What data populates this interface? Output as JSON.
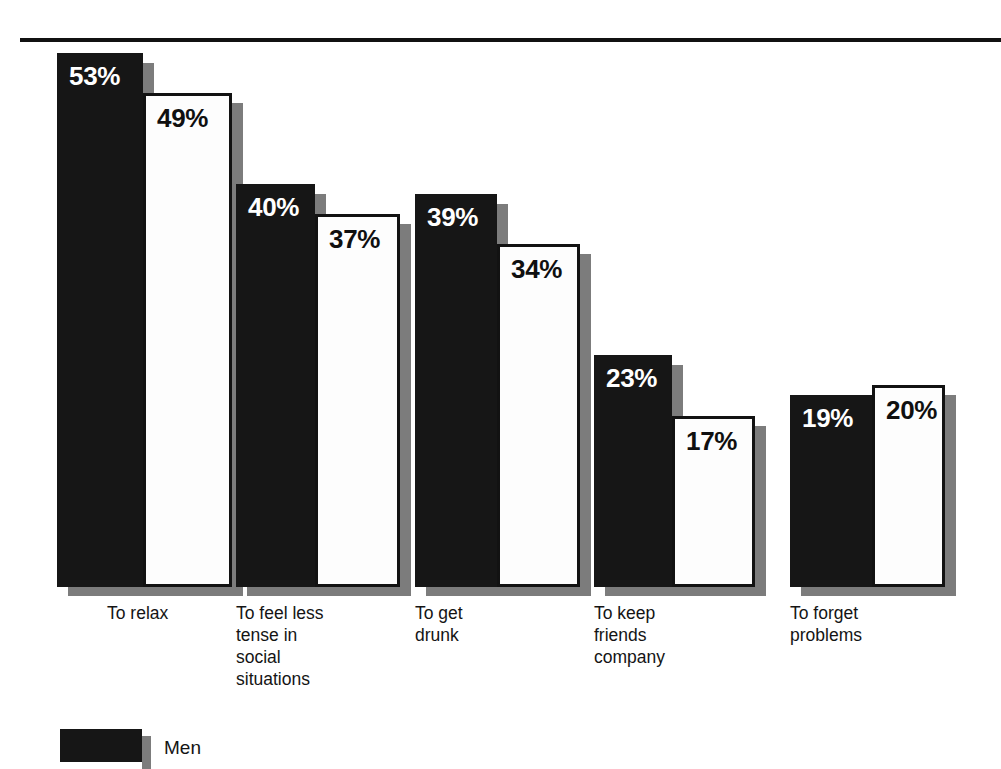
{
  "chart_data": {
    "type": "bar",
    "title": "",
    "subtitle": "",
    "xlabel": "",
    "ylabel": "",
    "ylim": [
      0,
      55
    ],
    "grid": false,
    "legend_position": "bottom-left",
    "value_suffix": "%",
    "categories": [
      "To relax",
      "To feel less\ntense in\nsocial\nsituations",
      "To get\ndrunk",
      "To keep\nfriends\ncompany",
      "To forget\nproblems"
    ],
    "series": [
      {
        "name": "Men",
        "color": "#161616",
        "values": [
          53,
          40,
          39,
          23,
          19
        ]
      },
      {
        "name": "Women",
        "color": "#fdfdfd",
        "values": [
          49,
          37,
          34,
          17,
          20
        ]
      }
    ],
    "value_labels": [
      [
        "53%",
        "49%"
      ],
      [
        "40%",
        "37%"
      ],
      [
        "39%",
        "34%"
      ],
      [
        "23%",
        "17%"
      ],
      [
        "19%",
        "20%"
      ]
    ]
  },
  "legend": {
    "entries": [
      {
        "label": "Men"
      }
    ]
  },
  "style": {
    "bar_black": "#161616",
    "bar_white": "#fdfdfd",
    "shadow_gray": "#7c7c7c",
    "rule_color": "#111111",
    "text_color": "#141414"
  },
  "geometry": {
    "baseline_y": 587,
    "rule_y": 38,
    "px_per_percent": 10.08,
    "groups": [
      {
        "men_x": 57,
        "men_w": 86,
        "women_x": 143,
        "women_w": 89
      },
      {
        "men_x": 236,
        "men_w": 79,
        "women_x": 315,
        "women_w": 85
      },
      {
        "men_x": 415,
        "men_w": 82,
        "women_x": 497,
        "women_w": 83
      },
      {
        "men_x": 594,
        "men_w": 78,
        "women_x": 672,
        "women_w": 83
      },
      {
        "men_x": 790,
        "men_w": 82,
        "women_x": 872,
        "women_w": 73
      }
    ],
    "label_x": [
      107,
      236,
      415,
      594,
      790
    ],
    "label_y": 602,
    "legend": {
      "sw_x": 60,
      "sw_y": 729,
      "sw_w": 82,
      "sw_h": 33,
      "txt_x": 164,
      "txt_y": 738
    }
  }
}
